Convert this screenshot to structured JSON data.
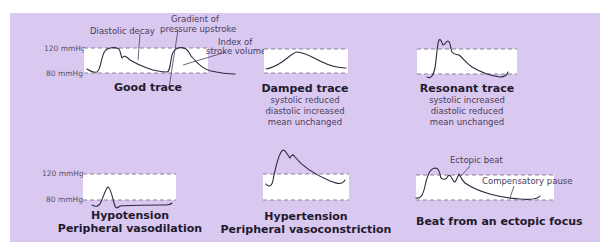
{
  "axis_labels": {
    "upper": "120 mmHg",
    "lower": "80 mmHg"
  },
  "panels": [
    {
      "id": "good",
      "title": "Good trace",
      "subtitle": [],
      "annotations": [
        "Diastolic decay",
        "Gradient of",
        "pressure upstroke",
        "Index of",
        "stroke volume"
      ]
    },
    {
      "id": "damped",
      "title": "Damped trace",
      "subtitle": [
        "systolic reduced",
        "diastolic increased",
        "mean unchanged"
      ],
      "annotations": []
    },
    {
      "id": "resonant",
      "title": "Resonant trace",
      "subtitle": [
        "systolic increased",
        "diastolic reduced",
        "mean unchanged"
      ],
      "annotations": []
    },
    {
      "id": "hypotension",
      "title": "Hypotension",
      "title2": "Peripheral vasodilation",
      "subtitle": [],
      "annotations": []
    },
    {
      "id": "hypertension",
      "title": "Hypertension",
      "title2": "Peripheral vasoconstriction",
      "subtitle": [],
      "annotations": []
    },
    {
      "id": "ectopic",
      "title": "Beat from an ectopic focus",
      "subtitle": [],
      "annotations": [
        "Ectopic beat",
        "Compensatory pause"
      ]
    }
  ],
  "colors": {
    "panel_bg": "#d9c8ef",
    "box_bg": "#ffffff",
    "trace": "#2d2740"
  }
}
